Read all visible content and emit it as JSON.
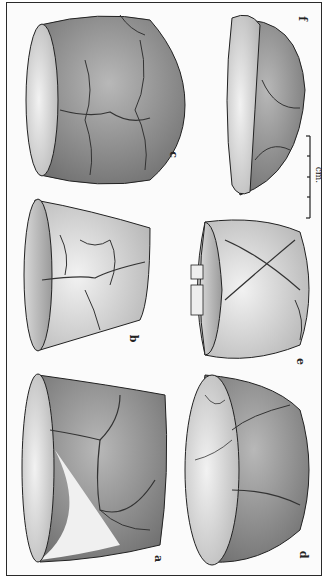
{
  "figure": {
    "type": "archaeological pottery illustration (rotated 90°)",
    "labels": {
      "a": "a",
      "b": "b",
      "c": "c",
      "d": "d",
      "e": "e",
      "f": "f"
    },
    "scale_bar": {
      "unit_label": "cm.",
      "ticks": 5
    }
  },
  "colors": {
    "ink": "#222222",
    "shade_dark": "#6a6a6a",
    "shade_mid": "#a8a8a8",
    "shade_light": "#dcdcdc",
    "paper": "#fbfbfb"
  }
}
